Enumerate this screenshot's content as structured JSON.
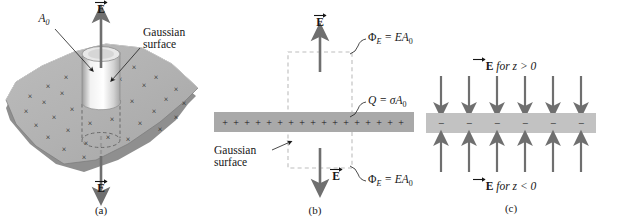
{
  "figure": {
    "background_color": "#ffffff",
    "ink_color": "#161616",
    "sheet_gray": "#b0b0b0",
    "sheet_gray_light": "#c9c9c9",
    "arrow_gray": "#707070",
    "dash_gray": "#b9b9b9"
  },
  "panel_a": {
    "tag": "(a)",
    "area_label": "A",
    "area_sub": "0",
    "gaussian_line1": "Gaussian",
    "gaussian_line2": "surface",
    "field_top": "E",
    "field_bottom": "E",
    "charge_glyph": "×",
    "charge_count": 31,
    "description": "Tilted charged sheet in perspective with cylindrical Gaussian surface piercing it; field arrows point up above and down below."
  },
  "panel_b": {
    "tag": "(b)",
    "field_top": "E",
    "field_bottom": "E",
    "flux_top": "Φ",
    "flux_top_sub": "E",
    "flux_top_rest": " = EA",
    "flux_top_rest_sub": "0",
    "flux_bottom": "Φ",
    "flux_bottom_sub": "E",
    "flux_bottom_rest": " = EA",
    "flux_bottom_rest_sub": "0",
    "charge_label": "Q",
    "charge_label_rest": " = σA",
    "charge_label_sub": "0",
    "gaussian_line1": "Gaussian",
    "gaussian_line2": "surface",
    "charge_glyph": "+",
    "charge_count": 17,
    "description": "Edge-on view of positively charged sheet with dashed rectangular Gaussian surface; flux EA0 leaves through top and bottom faces."
  },
  "panel_c": {
    "tag": "(c)",
    "label_top": "E",
    "label_top_rest": " for z > 0",
    "label_bottom": "E",
    "label_bottom_rest": " for z < 0",
    "charge_glyph": "−",
    "charge_count": 6,
    "arrow_count_top": 6,
    "arrow_count_bottom": 6,
    "description": "Negatively charged sheet with field arrows pointing inward toward the sheet from both sides."
  }
}
